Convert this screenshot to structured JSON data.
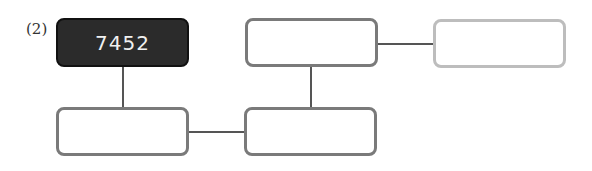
{
  "problem": {
    "label": "(2)",
    "start_value": "7452"
  },
  "boxes": [
    {
      "id": "start",
      "value": "7452"
    },
    {
      "id": "top-middle",
      "value": ""
    },
    {
      "id": "top-right",
      "value": ""
    },
    {
      "id": "bottom-left",
      "value": ""
    },
    {
      "id": "bottom-middle",
      "value": ""
    }
  ],
  "colors": {
    "start_fill": "#2b2b2b",
    "box_border": "#7a7a7a",
    "faded_border": "#bdbdbd",
    "connector": "#555555"
  }
}
